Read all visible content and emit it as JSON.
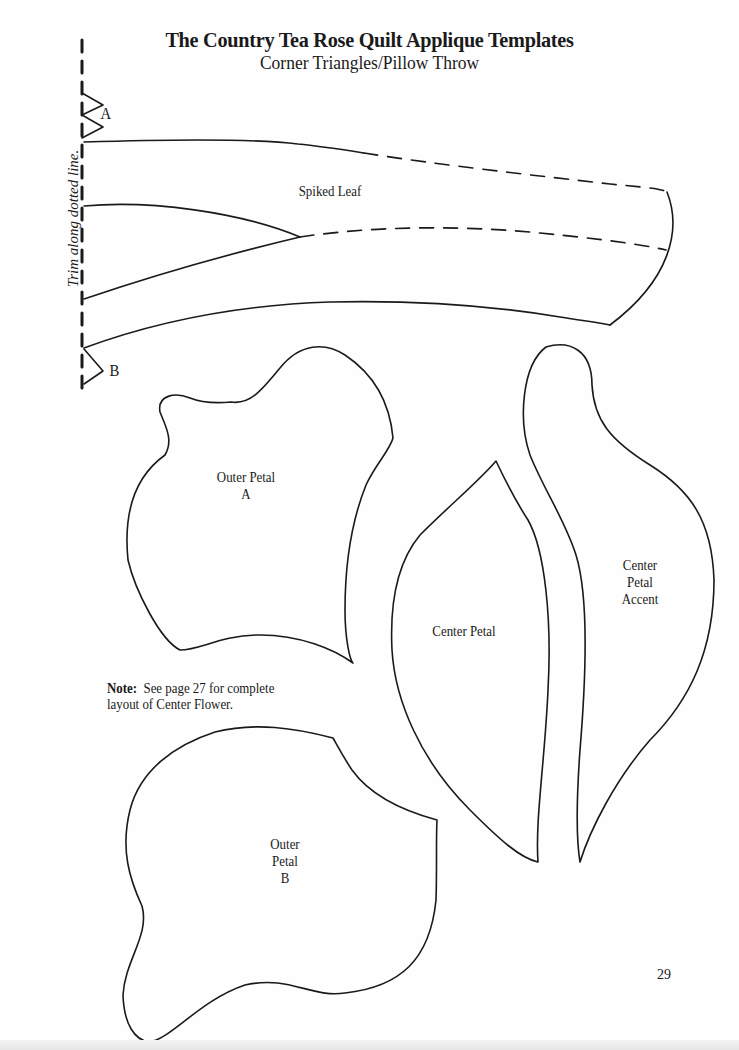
{
  "header": {
    "title": "The Country Tea Rose Quilt Applique Templates",
    "subtitle": "Corner Triangles/Pillow Throw"
  },
  "trim_instruction": "Trim along dotted line.",
  "markers": {
    "a": "A",
    "b": "B"
  },
  "templates": {
    "spiked_leaf": "Spiked Leaf",
    "outer_petal_a": {
      "line1": "Outer Petal",
      "line2": "A"
    },
    "center_petal": "Center Petal",
    "center_petal_accent": {
      "line1": "Center",
      "line2": "Petal",
      "line3": "Accent"
    },
    "outer_petal_b": {
      "line1": "Outer",
      "line2": "Petal",
      "line3": "B"
    }
  },
  "note": {
    "label": "Note:",
    "text_line1": "See page 27 for complete",
    "text_line2": "layout of Center Flower."
  },
  "page_number": "29",
  "colors": {
    "ink": "#1a1a1a",
    "paper": "#fefefe"
  }
}
